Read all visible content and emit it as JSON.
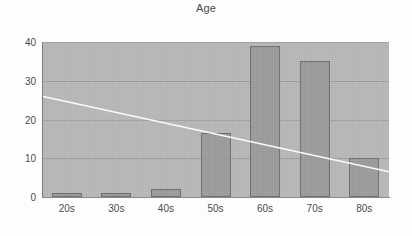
{
  "chart_data": {
    "type": "bar",
    "title": "Age",
    "xlabel": "",
    "ylabel": "",
    "categories": [
      "20s",
      "30s",
      "40s",
      "50s",
      "60s",
      "70s",
      "80s"
    ],
    "values": [
      1,
      1,
      2,
      16.5,
      39,
      35,
      10
    ],
    "ylim": [
      0,
      40
    ],
    "yticks": [
      0,
      10,
      20,
      30,
      40
    ],
    "ytick_labels": [
      "0",
      "10",
      "20",
      "30",
      "40"
    ],
    "grid": true,
    "legend": "none",
    "series": [
      {
        "name": "Age",
        "type": "bar",
        "values": [
          1,
          1,
          2,
          16.5,
          39,
          35,
          10
        ],
        "bar_color": "#9c9c9c",
        "bar_border_color": "#6e6e6e"
      },
      {
        "name": "trendline",
        "type": "line",
        "line_color": "#ffffff",
        "x_start_value": 26,
        "x_end_value": 6.5,
        "note": "white descending linear trend line across plot"
      }
    ],
    "plot_background": "#b9b9b9",
    "page_background": "#fdfdfd",
    "axis_color": "#7d7d7d"
  }
}
